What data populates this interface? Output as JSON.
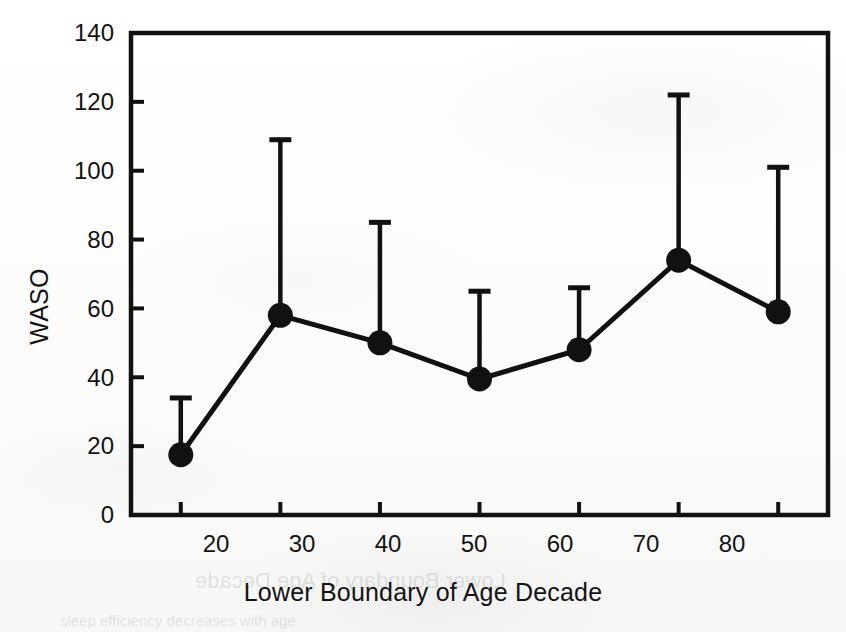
{
  "figure": {
    "kind": "scanned-scientific-figure",
    "background_color": "#fdfdfc",
    "ink_color": "#111111"
  },
  "ylabel_text": "WASO",
  "xlabel_text": "Lower Boundary of Age Decade",
  "ghost_texts": {
    "xlabel_mirror": "Lower Boundary of Age Decade",
    "body_line": "sleep efficiency decreases with age"
  },
  "chart_data": {
    "type": "line",
    "title": "",
    "subtitle": "",
    "xlabel": "Lower Boundary of Age Decade",
    "ylabel": "WASO",
    "x": [
      20,
      30,
      40,
      50,
      60,
      70,
      80
    ],
    "xtick_labels": [
      "20",
      "30",
      "40",
      "50",
      "60",
      "70",
      "80"
    ],
    "ytick_labels": [
      "0",
      "20",
      "40",
      "60",
      "80",
      "100",
      "120",
      "140"
    ],
    "ytick_values": [
      0,
      20,
      40,
      60,
      80,
      100,
      120,
      140
    ],
    "xlim": [
      15,
      85
    ],
    "ylim": [
      0,
      140
    ],
    "grid": false,
    "legend": null,
    "marker": "filled-circle",
    "error_bar_direction": "upper-only",
    "series": [
      {
        "name": "WASO",
        "values": [
          17.5,
          58,
          50,
          39.5,
          48,
          74,
          59
        ],
        "error_upper": [
          34,
          109,
          85,
          65,
          66,
          122,
          101
        ]
      }
    ],
    "annotations": []
  },
  "plot_geometry": {
    "left": 131,
    "right": 828,
    "top": 33,
    "bottom": 515
  }
}
